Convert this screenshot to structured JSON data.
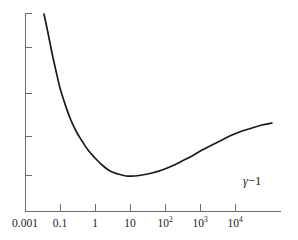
{
  "chart_data": {
    "type": "line",
    "title": "",
    "subtitle": "",
    "xlabel": "γ−1",
    "ylabel": "",
    "xscale": "log",
    "yscale": "linear",
    "grid": false,
    "legend": null,
    "xlim": [
      0.001,
      100000
    ],
    "ylim": [
      0,
      1
    ],
    "xticks": [
      {
        "value": 0.001,
        "label": "0.001",
        "exponent": null,
        "x_px": 25
      },
      {
        "value": 0.1,
        "label": "0.1",
        "exponent": null,
        "x_px": 60
      },
      {
        "value": 1,
        "label": "1",
        "exponent": null,
        "x_px": 95
      },
      {
        "value": 10,
        "label": "10",
        "exponent": null,
        "x_px": 130
      },
      {
        "value": 100,
        "label": "10",
        "exponent": "2",
        "x_px": 165
      },
      {
        "value": 1000,
        "label": "10",
        "exponent": "3",
        "x_px": 200
      },
      {
        "value": 10000,
        "label": "10",
        "exponent": "4",
        "x_px": 235
      }
    ],
    "yticks": [
      {
        "label": "",
        "y_px": 13
      },
      {
        "label": "",
        "y_px": 47
      },
      {
        "label": "",
        "y_px": 93
      },
      {
        "label": "",
        "y_px": 136
      },
      {
        "label": "",
        "y_px": 175
      }
    ],
    "annotations": [
      {
        "text": "γ−1",
        "x_px": 243,
        "y_px": 175
      }
    ],
    "series": [
      {
        "name": "energy-loss-curve",
        "color": "#1a1a1a",
        "points_px": [
          [
            44,
            14
          ],
          [
            48,
            33
          ],
          [
            52,
            53
          ],
          [
            56,
            71
          ],
          [
            60,
            88
          ],
          [
            65,
            104
          ],
          [
            70,
            118
          ],
          [
            76,
            131
          ],
          [
            82,
            141
          ],
          [
            88,
            150
          ],
          [
            95,
            158
          ],
          [
            102,
            165
          ],
          [
            110,
            171
          ],
          [
            118,
            174
          ],
          [
            126,
            176
          ],
          [
            134,
            176
          ],
          [
            142,
            175
          ],
          [
            152,
            173
          ],
          [
            162,
            170
          ],
          [
            172,
            166
          ],
          [
            182,
            161
          ],
          [
            192,
            156
          ],
          [
            202,
            150
          ],
          [
            212,
            145
          ],
          [
            222,
            140
          ],
          [
            232,
            135
          ],
          [
            242,
            131
          ],
          [
            252,
            128
          ],
          [
            262,
            125
          ],
          [
            272,
            123
          ]
        ],
        "description_points": [
          {
            "x": 0.0025,
            "y_rel": 1.0
          },
          {
            "x": 0.1,
            "y_rel": 0.37
          },
          {
            "x": 1.0,
            "y_rel": 0.1
          },
          {
            "x": 3.0,
            "y_rel": 0.05
          },
          {
            "x": 10,
            "y_rel": 0.06
          },
          {
            "x": 100,
            "y_rel": 0.13
          },
          {
            "x": 1000,
            "y_rel": 0.21
          },
          {
            "x": 10000,
            "y_rel": 0.28
          },
          {
            "x": 40000,
            "y_rel": 0.31
          }
        ]
      }
    ],
    "colors": {
      "curve": "#1a1a1a",
      "axis": "#6b6b6b",
      "background": "#ffffff",
      "text": "#1a1a1a"
    }
  },
  "axes": {
    "y_axis_x_px": 25,
    "y_axis_top_px": 13,
    "y_axis_bottom_px": 211,
    "x_axis_y_px": 211,
    "x_axis_left_px": 25,
    "x_axis_right_px": 281
  }
}
